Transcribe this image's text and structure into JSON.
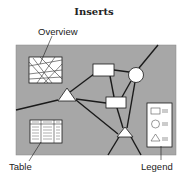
{
  "title": "Inserts",
  "labels": {
    "overview": "Overview",
    "table": "Table",
    "legend": "Legend"
  },
  "colors": {
    "map_background": "#a7a7a7",
    "inset_fill": "#ffffff",
    "line": "#1a1a1a"
  },
  "diagram": {
    "nodes": [
      {
        "id": "rect-top",
        "shape": "rectangle"
      },
      {
        "id": "circle",
        "shape": "circle"
      },
      {
        "id": "triangle-left",
        "shape": "triangle"
      },
      {
        "id": "rect-mid",
        "shape": "rectangle"
      },
      {
        "id": "triangle-bottom",
        "shape": "triangle"
      }
    ],
    "insets": [
      {
        "id": "overview-inset",
        "content": "overview map"
      },
      {
        "id": "table-inset",
        "content": "table"
      },
      {
        "id": "legend-inset",
        "content": "legend",
        "entries": [
          "rectangle",
          "circle",
          "triangle"
        ]
      }
    ]
  }
}
